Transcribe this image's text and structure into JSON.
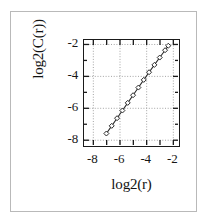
{
  "figure": {
    "background_color": "#ffffff",
    "frame_color": "#b9b9b9",
    "axis_color": "#1a1a1a",
    "grid_color": "#9a9a9a",
    "marker_edge_color": "#2b2b2b",
    "marker_face_color": "#ffffff",
    "line_color": "#2b2b2b"
  },
  "chart_data": {
    "type": "scatter",
    "title": "",
    "xlabel": "log2(r)",
    "ylabel": "log2(C(r))",
    "xlim": [
      -8.7,
      -1.65
    ],
    "ylim": [
      -8.3,
      -1.72
    ],
    "xticks": [
      -8,
      -6,
      -4,
      -2
    ],
    "yticks": [
      -2,
      -4,
      -6,
      -8
    ],
    "xticklabels": [
      "-8",
      "-6",
      "-4",
      "-2"
    ],
    "yticklabels": [
      "-2",
      "-4",
      "-6",
      "-8"
    ],
    "grid": true,
    "grid_style": "dotted",
    "legend": null,
    "marker": "open-diamond",
    "line_style": "solid",
    "series": [
      {
        "name": "log2(C(r)) vs log2(r)",
        "x": [
          -7.02,
          -6.62,
          -6.22,
          -5.82,
          -5.42,
          -5.02,
          -4.62,
          -4.22,
          -3.82,
          -3.42,
          -3.02,
          -2.62,
          -2.38
        ],
        "y": [
          -7.58,
          -7.1,
          -6.62,
          -6.14,
          -5.66,
          -5.18,
          -4.7,
          -4.22,
          -3.74,
          -3.28,
          -2.82,
          -2.36,
          -2.08
        ]
      }
    ],
    "fit": {
      "slope": 1.19,
      "description": "correlation dimension log-log scaling"
    }
  },
  "axis_titles": {
    "x": "log2(r)",
    "y": "log2(C(r))"
  }
}
